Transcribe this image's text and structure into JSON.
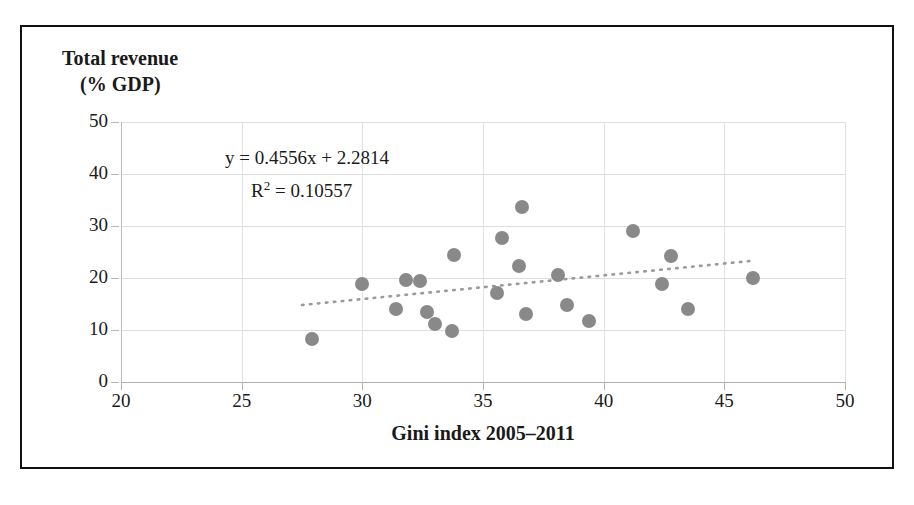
{
  "figure": {
    "y_axis_title_line1": "Total revenue",
    "y_axis_title_line2": "(% GDP)",
    "equation_line": "y = 0.4556x + 2.2814",
    "r_squared_prefix": "R",
    "r_squared_exponent": "2",
    "r_squared_value": " = 0.10557"
  },
  "chart_data": {
    "type": "scatter",
    "title": "",
    "xlabel": "Gini index 2005–2011",
    "ylabel": "Total revenue (% GDP)",
    "xlim": [
      20,
      50
    ],
    "ylim": [
      0,
      50
    ],
    "xticks": [
      20,
      25,
      30,
      35,
      40,
      45,
      50
    ],
    "yticks": [
      0,
      10,
      20,
      30,
      40,
      50
    ],
    "xtick_labels": [
      "20",
      "25",
      "30",
      "35",
      "40",
      "45",
      "50"
    ],
    "ytick_labels": [
      "0",
      "10",
      "20",
      "30",
      "40",
      "50"
    ],
    "grid": true,
    "legend": false,
    "marker_color": "#898989",
    "trendline": {
      "type": "linear",
      "style": "dotted",
      "color": "#9a9a9a",
      "equation": "y = 0.4556x + 2.2814",
      "r_squared": 0.10557,
      "slope": 0.4556,
      "intercept": 2.2814,
      "x_start": 27.5,
      "x_end": 46.3
    },
    "points": [
      {
        "x": 27.9,
        "y": 8.3
      },
      {
        "x": 30.0,
        "y": 18.8
      },
      {
        "x": 31.4,
        "y": 14.0
      },
      {
        "x": 31.8,
        "y": 19.7
      },
      {
        "x": 32.4,
        "y": 19.4
      },
      {
        "x": 32.7,
        "y": 13.5
      },
      {
        "x": 33.0,
        "y": 11.2
      },
      {
        "x": 33.7,
        "y": 9.9
      },
      {
        "x": 33.8,
        "y": 24.4
      },
      {
        "x": 35.6,
        "y": 17.2
      },
      {
        "x": 35.8,
        "y": 27.6
      },
      {
        "x": 36.5,
        "y": 22.3
      },
      {
        "x": 36.6,
        "y": 33.6
      },
      {
        "x": 36.8,
        "y": 13.1
      },
      {
        "x": 38.1,
        "y": 20.6
      },
      {
        "x": 38.5,
        "y": 14.8
      },
      {
        "x": 39.4,
        "y": 11.8
      },
      {
        "x": 41.2,
        "y": 29.0
      },
      {
        "x": 42.4,
        "y": 18.9
      },
      {
        "x": 42.8,
        "y": 24.3
      },
      {
        "x": 43.5,
        "y": 14.1
      },
      {
        "x": 46.2,
        "y": 20.0
      }
    ]
  }
}
